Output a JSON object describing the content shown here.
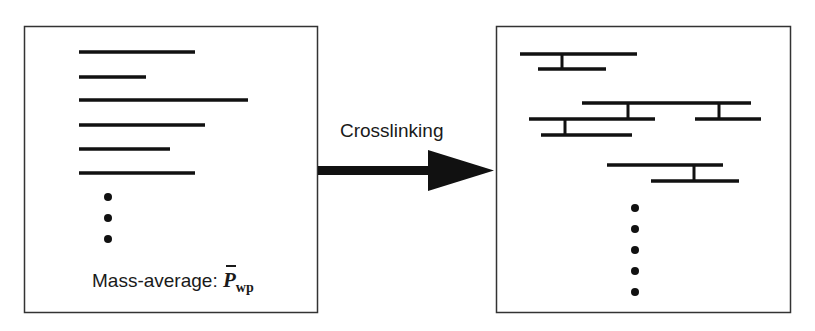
{
  "left_panel": {
    "label": "Mass-average:",
    "symbol": "P",
    "symbol_subscript": "wp",
    "chains": [
      {
        "x1": 79,
        "x2": 195,
        "y": 52
      },
      {
        "x1": 79,
        "x2": 146,
        "y": 77
      },
      {
        "x1": 79,
        "x2": 248,
        "y": 100
      },
      {
        "x1": 79,
        "x2": 205,
        "y": 125
      },
      {
        "x1": 79,
        "x2": 170,
        "y": 149
      },
      {
        "x1": 79,
        "x2": 195,
        "y": 173
      }
    ],
    "ellipsis_dots": 3
  },
  "arrow": {
    "label": "Crosslinking"
  },
  "right_panel": {
    "chains": [
      {
        "x1": 520,
        "x2": 637,
        "y": 54
      },
      {
        "x1": 538,
        "x2": 606,
        "y": 69
      },
      {
        "x1": 582,
        "x2": 751,
        "y": 103
      },
      {
        "x1": 529,
        "x2": 655,
        "y": 119
      },
      {
        "x1": 695,
        "x2": 761,
        "y": 119
      },
      {
        "x1": 541,
        "x2": 632,
        "y": 135
      },
      {
        "x1": 607,
        "x2": 723,
        "y": 165
      },
      {
        "x1": 651,
        "x2": 739,
        "y": 181
      }
    ],
    "crosslinks": [
      {
        "x": 562,
        "y1": 54,
        "y2": 69
      },
      {
        "x": 628,
        "y1": 103,
        "y2": 119
      },
      {
        "x": 719,
        "y1": 103,
        "y2": 119
      },
      {
        "x": 565,
        "y1": 119,
        "y2": 135
      },
      {
        "x": 694,
        "y1": 165,
        "y2": 181
      }
    ],
    "ellipsis_dots": 5
  }
}
